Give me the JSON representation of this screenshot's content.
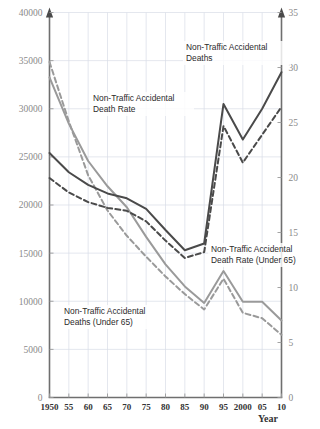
{
  "chart_data": {
    "type": "line",
    "title": "",
    "xlabel": "Year",
    "ylabel": "",
    "grid": true,
    "legend": "annotations-inline",
    "x": [
      1950,
      1955,
      1960,
      1965,
      1970,
      1975,
      1980,
      1985,
      1990,
      1995,
      2000,
      2005,
      2010
    ],
    "xtick_labels": [
      "1950",
      "55",
      "60",
      "65",
      "70",
      "75",
      "80",
      "85",
      "90",
      "95",
      "2000",
      "05",
      "10"
    ],
    "left_axis": {
      "label": "",
      "ylim": [
        0,
        40000
      ],
      "ticks": [
        0,
        5000,
        10000,
        15000,
        20000,
        25000,
        30000,
        35000,
        40000
      ],
      "tick_labels": [
        "0",
        "5000",
        "10000",
        "15000",
        "20000",
        "25000",
        "30000",
        "35000",
        "40000"
      ]
    },
    "right_axis": {
      "label": "",
      "ylim": [
        0,
        35
      ],
      "ticks": [
        0,
        5,
        10,
        15,
        20,
        25,
        30,
        35
      ],
      "tick_labels": [
        "0",
        "5",
        "10",
        "15",
        "20",
        "25",
        "30",
        "35"
      ]
    },
    "series": [
      {
        "name": "Non-Traffic Accidental Deaths",
        "axis": "left",
        "style": "solid",
        "color": "#4a4a4a",
        "values": [
          25400,
          23400,
          22100,
          21200,
          20700,
          19600,
          17400,
          15300,
          16000,
          30500,
          26800,
          30000,
          33800
        ]
      },
      {
        "name": "Non-Traffic Accidental Deaths (Under 65)",
        "axis": "left",
        "style": "dashed",
        "color": "#4a4a4a",
        "values": [
          22800,
          21300,
          20300,
          19700,
          19400,
          18300,
          16300,
          14500,
          15100,
          28200,
          24400,
          27300,
          30200
        ]
      },
      {
        "name": "Non-Traffic Accidental Death Rate",
        "axis": "right",
        "style": "solid",
        "color": "#9a9a9a",
        "values": [
          29.1,
          24.9,
          21.5,
          19.2,
          17.3,
          14.6,
          12.1,
          10.1,
          8.6,
          11.5,
          8.7,
          8.7,
          7.0
        ]
      },
      {
        "name": "Non-Traffic Accidental Death Rate (Under 65)",
        "axis": "right",
        "style": "dashed",
        "color": "#9a9a9a",
        "values": [
          30.5,
          25.1,
          20.2,
          17.0,
          14.7,
          12.8,
          11.0,
          9.4,
          8.0,
          10.8,
          7.7,
          7.2,
          5.7
        ]
      }
    ],
    "annotations": [
      {
        "id": "ann-deaths",
        "text_line1": "Non-Traffic Accidental",
        "text_line2": "Deaths"
      },
      {
        "id": "ann-rate",
        "text_line1": "Non-Traffic Accidental",
        "text_line2": "Death Rate"
      },
      {
        "id": "ann-rate-u65",
        "text_line1": "Non-Traffic Accidental",
        "text_line2": "Death Rate (Under 65)"
      },
      {
        "id": "ann-deaths-u65",
        "text_line1": "Non-Traffic Accidental",
        "text_line2": "Deaths (Under 65)"
      }
    ],
    "colors": {
      "dark_series": "#4a4a4a",
      "gray_series": "#9a9a9a",
      "grid": "#d8dde6",
      "axis": "#6f6f6f",
      "tick_text": "#8a8a8a",
      "background": "#ffffff"
    }
  }
}
